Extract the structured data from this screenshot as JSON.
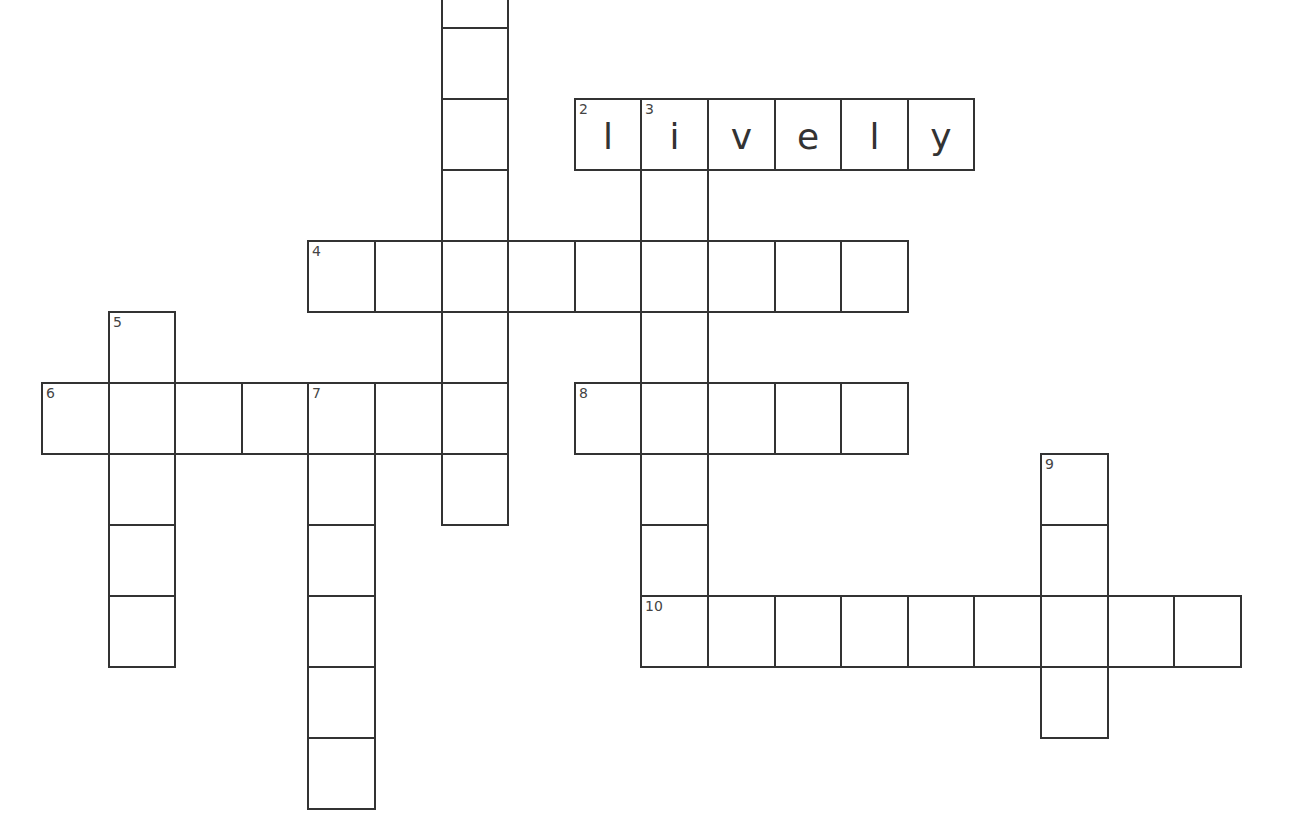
{
  "puzzle": {
    "grid": {
      "origin_x": 42,
      "origin_y": -43,
      "cell_w": 66.6,
      "cell_h": 71,
      "line_color": "#333333",
      "background": "#ffffff"
    },
    "words": [
      {
        "number": null,
        "hidden_number": 1,
        "direction": "down",
        "row": 0,
        "col": 6,
        "length": 8,
        "answer": ""
      },
      {
        "number": 2,
        "direction": "across",
        "row": 2,
        "col": 8,
        "length": 6,
        "answer": "lively"
      },
      {
        "number": 3,
        "direction": "down",
        "row": 2,
        "col": 9,
        "length": 8,
        "answer": "i"
      },
      {
        "number": 4,
        "direction": "across",
        "row": 4,
        "col": 4,
        "length": 9,
        "answer": ""
      },
      {
        "number": 5,
        "direction": "down",
        "row": 5,
        "col": 1,
        "length": 5,
        "answer": ""
      },
      {
        "number": 6,
        "direction": "across",
        "row": 6,
        "col": 0,
        "length": 7,
        "answer": ""
      },
      {
        "number": 7,
        "direction": "down",
        "row": 6,
        "col": 4,
        "length": 6,
        "answer": ""
      },
      {
        "number": 8,
        "direction": "across",
        "row": 6,
        "col": 8,
        "length": 5,
        "answer": ""
      },
      {
        "number": 9,
        "direction": "down",
        "row": 7,
        "col": 15,
        "length": 4,
        "answer": ""
      },
      {
        "number": 10,
        "direction": "across",
        "row": 9,
        "col": 9,
        "length": 9,
        "answer": ""
      }
    ]
  }
}
